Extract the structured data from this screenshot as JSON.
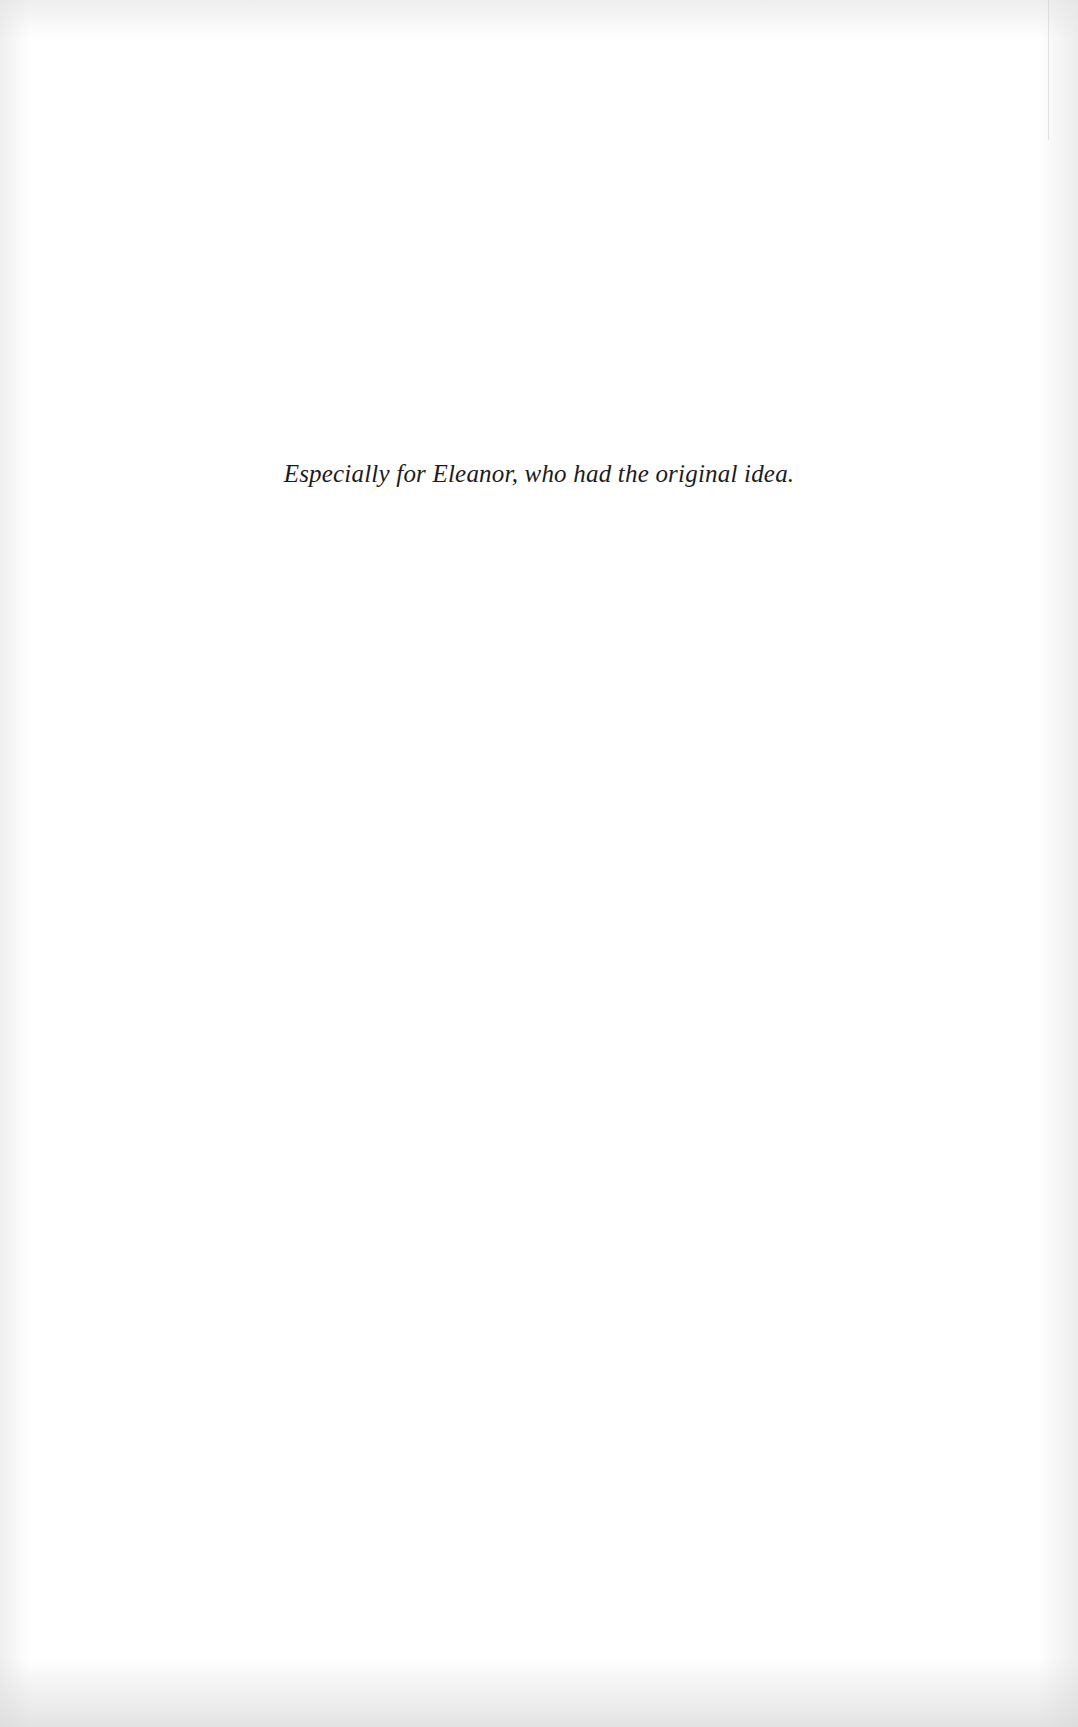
{
  "page": {
    "type": "dedication",
    "dedication_text": "Especially for Eleanor, who had the original idea."
  },
  "colors": {
    "paper": "#ffffff",
    "text": "#1c1c1c",
    "edge_shadow": "#d7d7d7"
  }
}
